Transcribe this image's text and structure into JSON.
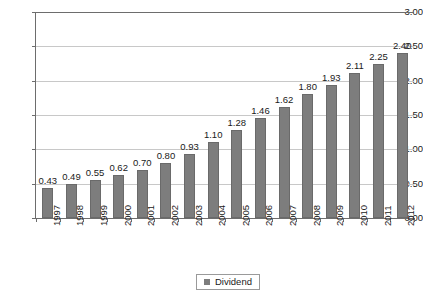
{
  "chart_data": {
    "type": "bar",
    "title": "",
    "subtitle": "",
    "xlabel": "",
    "ylabel": "",
    "categories": [
      "1997",
      "1998",
      "1999",
      "2000",
      "2001",
      "2002",
      "2003",
      "2004",
      "2005",
      "2006",
      "2007",
      "2008",
      "2009",
      "2010",
      "2011",
      "2012"
    ],
    "series": [
      {
        "name": "Dividend",
        "color": "#7d7d7d",
        "values": [
          0.43,
          0.49,
          0.55,
          0.62,
          0.7,
          0.8,
          0.93,
          1.1,
          1.28,
          1.46,
          1.62,
          1.8,
          1.93,
          2.11,
          2.25,
          2.4
        ],
        "value_labels": [
          "0.43",
          "0.49",
          "0.55",
          "0.62",
          "0.70",
          "0.80",
          "0.93",
          "1.10",
          "1.28",
          "1.46",
          "1.62",
          "1.80",
          "1.93",
          "2.11",
          "2.25",
          "2.40"
        ]
      }
    ],
    "ylim": [
      0,
      3.0
    ],
    "ytick_values": [
      0,
      0.5,
      1.0,
      1.5,
      2.0,
      2.5,
      3.0
    ],
    "ytick_labels": [
      "0.00",
      "0.50",
      "1.00",
      "1.50",
      "2.00",
      "2.50",
      "3.00"
    ],
    "grid": true,
    "grid_axis": "y",
    "legend_position": "bottom-center",
    "data_labels_shown": true,
    "xtick_rotation": 90
  },
  "legend": {
    "entries": [
      {
        "label": "Dividend",
        "color": "#7d7d7d"
      }
    ]
  },
  "colors": {
    "bar": "#7d7d7d",
    "bar_border": "#6a6a6a",
    "gridline": "#c8c8c8",
    "axis": "#6d6d6d",
    "text": "#1a1a1a",
    "background": "#ffffff"
  }
}
